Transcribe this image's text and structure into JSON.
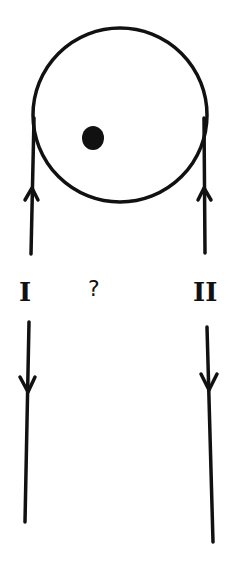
{
  "diagram": {
    "title": "",
    "labels": {
      "left_strand": "I",
      "right_strand": "II",
      "question": "?"
    },
    "elements": {
      "pulley": {
        "shape": "circle",
        "cx": 120,
        "cy": 115,
        "r": 87
      },
      "axle": {
        "shape": "dot",
        "cx": 93,
        "cy": 138
      },
      "strand_I_upper": {
        "direction": "up"
      },
      "strand_I_lower": {
        "direction": "down"
      },
      "strand_II_upper": {
        "direction": "up"
      },
      "strand_II_lower": {
        "direction": "down"
      }
    },
    "colors": {
      "ink": "#111111",
      "background": "#ffffff"
    }
  }
}
